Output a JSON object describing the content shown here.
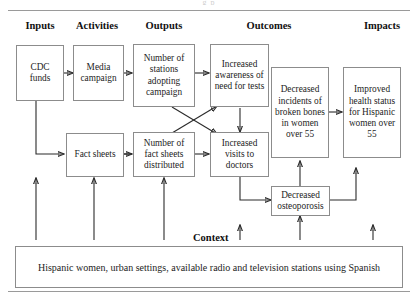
{
  "figure": {
    "running_head": "g p",
    "context_label": "Context"
  },
  "columns": [
    {
      "id": "inputs",
      "label": "Inputs"
    },
    {
      "id": "activities",
      "label": "Activities"
    },
    {
      "id": "outputs",
      "label": "Outputs"
    },
    {
      "id": "outcomes",
      "label": "Outcomes"
    },
    {
      "id": "impacts",
      "label": "Impacts"
    }
  ],
  "nodes": {
    "cdc_funds": "CDC funds",
    "media_campaign": "Media campaign",
    "fact_sheets": "Fact sheets",
    "stations_adopting": "Number of stations adopting campaign",
    "fact_sheets_distributed": "Number of fact sheets distributed",
    "increased_awareness": "Increased awareness of need for tests",
    "increased_visits": "Increased visits to doctors",
    "decreased_incidents": "Decreased incidents of broken bones in women over 55",
    "decreased_osteoporosis": "Decreased osteoporosis",
    "improved_health": "Improved health status for Hispanic women over 55"
  },
  "context": {
    "text": "Hispanic women, urban settings, available radio and television stations using Spanish"
  },
  "colors": {
    "box_border": "#8c8c8c",
    "arrow": "#2b2b2b",
    "rule": "#9a9a9a",
    "text": "#1d1d1d"
  }
}
